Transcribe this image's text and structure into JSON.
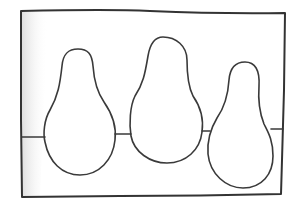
{
  "image": {
    "description": "Hand-drawn line sketch of three pear-shaped forms inside a rectangular frame, joined by a horizontal line",
    "colors": {
      "background": "#ffffff",
      "ink": "#3a3a3a",
      "shading": "#e6e6e6"
    },
    "frame": {
      "label": "rectangular frame",
      "corners": [
        [
          21,
          11
        ],
        [
          285,
          13
        ],
        [
          281,
          194
        ],
        [
          22,
          197
        ]
      ]
    },
    "horizon_line": {
      "label": "horizontal line connecting shapes"
    },
    "shapes": [
      {
        "label": "pear shape 1",
        "top": [
          78,
          49
        ],
        "bottom": [
          80,
          175
        ]
      },
      {
        "label": "pear shape 2",
        "top": [
          163,
          37
        ],
        "bottom": [
          167,
          163
        ]
      },
      {
        "label": "pear shape 3",
        "top": [
          245,
          62
        ],
        "bottom": [
          243,
          188
        ]
      }
    ]
  }
}
